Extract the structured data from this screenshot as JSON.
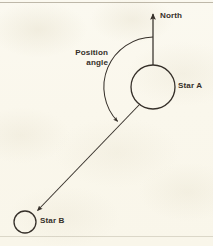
{
  "figure": {
    "type": "astronomy-diagram",
    "background_color": "#faf8ed",
    "ink_color": "#36302a"
  },
  "labels": {
    "north": "North",
    "star_a": "Star A",
    "star_b": "Star B",
    "position_angle_line1": "Position",
    "position_angle_line2": "angle"
  },
  "elements": {
    "north_arrow": {
      "name": "north-direction-arrow",
      "from": [
        153,
        65
      ],
      "to": [
        153,
        13
      ],
      "direction": "up"
    },
    "star_a_circle": {
      "name": "star-a",
      "center": [
        153,
        87
      ],
      "radius": 22
    },
    "star_b_circle": {
      "name": "star-b",
      "center": [
        25,
        222
      ],
      "radius": 11
    },
    "separation_arrow": {
      "name": "star-a-to-star-b-arrow",
      "from": [
        140,
        104
      ],
      "to": [
        36,
        212
      ],
      "direction": "toward-star-b"
    },
    "angle_arc": {
      "name": "position-angle-arc",
      "center": [
        153,
        87
      ],
      "radius": 50,
      "start_deg": 90,
      "end_deg": 225,
      "sweep": "counterclockwise",
      "arrow_at": "end"
    }
  }
}
